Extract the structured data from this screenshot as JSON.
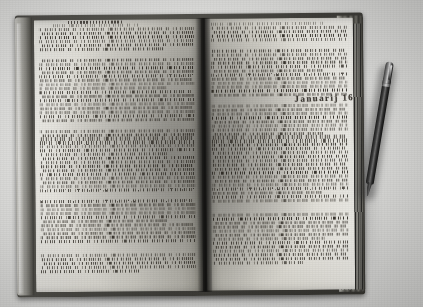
{
  "photo": {
    "subject": "open antique manuscript book",
    "medium": "black and white photograph",
    "background_color": "#d8d8d6",
    "surface_description": "plain light gray tabletop"
  },
  "book": {
    "state": "open flat, two facing pages",
    "cover_color": "#45443f",
    "binding": "dark leather boards with visible fore-edge page block",
    "spine_position": "center, vertical gutter shadow",
    "left_board_highlight_color": "#c8c7c2",
    "fore_edge_color": "#4a4943"
  },
  "left_page": {
    "name": "verso",
    "ink_color": "#241f19",
    "paper_color": "#e1dfd8",
    "script": "dense brown-black cursive secretary hand",
    "heading_visible": true,
    "line_count": 58,
    "paragraph_breaks": [
      8,
      24,
      41,
      53
    ]
  },
  "right_page": {
    "name": "recto",
    "ink_color": "#241f19",
    "paper_color": "#e3e1da",
    "script": "dense brown-black cursive secretary hand",
    "line_count": 58,
    "paragraph_breaks": [
      5,
      18,
      44
    ],
    "date_inscription": "Januarij  1620"
  },
  "pen": {
    "label": "ballpoint pen",
    "position": "resting diagonally on the table to the right of the book",
    "body_color": "#1b1b1b",
    "cap_color": "#9a9a9a",
    "has_clip": true,
    "angle_degrees": 9.5
  }
}
